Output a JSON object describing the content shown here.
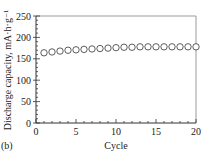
{
  "panel_label": "(b)",
  "chart_data": {
    "type": "scatter",
    "title": "",
    "xlabel": "Cycle",
    "ylabel": "Discharge capacity, mA·h·g⁻¹",
    "xlim": [
      0,
      20
    ],
    "ylim": [
      0,
      250
    ],
    "x_ticks": [
      0,
      5,
      10,
      15,
      20
    ],
    "y_ticks": [
      0,
      50,
      100,
      150,
      200,
      250
    ],
    "x_minor_step": 1,
    "y_minor_step": 10,
    "grid": false,
    "legend": null,
    "marker": "open-circle",
    "series": [
      {
        "name": "Discharge capacity",
        "x": [
          1,
          2,
          3,
          4,
          5,
          6,
          7,
          8,
          9,
          10,
          11,
          12,
          13,
          14,
          15,
          16,
          17,
          18,
          19,
          20
        ],
        "values": [
          164,
          166,
          168,
          170,
          171,
          172,
          173,
          174,
          175,
          176,
          177,
          177,
          178,
          178,
          178,
          178,
          178,
          178,
          178,
          178
        ]
      }
    ]
  }
}
